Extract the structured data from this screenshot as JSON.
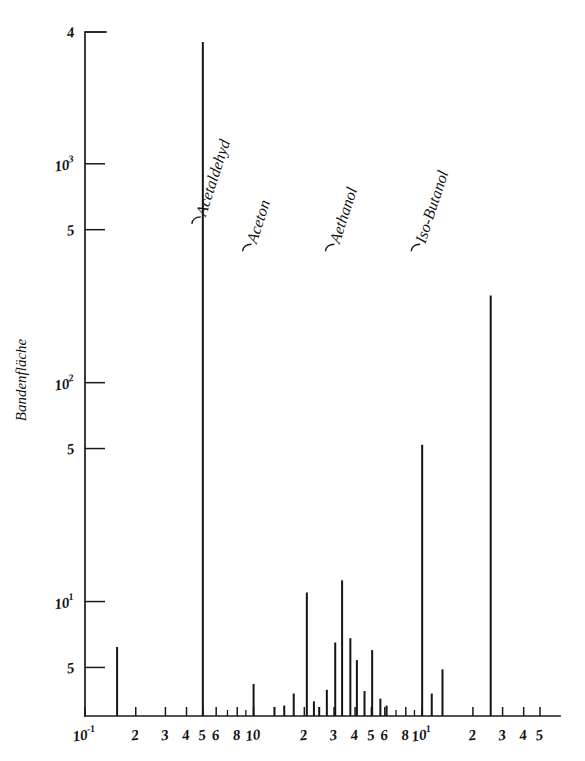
{
  "figure": {
    "title": "",
    "background_color": "#ffffff",
    "ink_color": "#141414"
  },
  "chart_data": {
    "type": "bar",
    "title": "",
    "subtitle": "",
    "xlabel": "",
    "ylabel": "Bandenfläche",
    "xscale": "log",
    "yscale": "log",
    "xlim": [
      0.1,
      50
    ],
    "ylim": [
      3,
      4000
    ],
    "grid": false,
    "legend": "none",
    "x_tick_labels": [
      {
        "value": 0.1,
        "label": "10",
        "sup": "-1",
        "major": true
      },
      {
        "value": 0.2,
        "label": "2",
        "sup": "",
        "major": true
      },
      {
        "value": 0.3,
        "label": "3",
        "sup": "",
        "major": true
      },
      {
        "value": 0.4,
        "label": "4",
        "sup": "",
        "major": true
      },
      {
        "value": 0.5,
        "label": "5",
        "sup": "",
        "major": true
      },
      {
        "value": 0.6,
        "label": "6",
        "sup": "",
        "major": true
      },
      {
        "value": 0.8,
        "label": "8",
        "sup": "",
        "major": true
      },
      {
        "value": 1.0,
        "label": "10",
        "sup": "",
        "major": true
      },
      {
        "value": 2.0,
        "label": "2",
        "sup": "",
        "major": true
      },
      {
        "value": 3.0,
        "label": "3",
        "sup": "",
        "major": true
      },
      {
        "value": 4.0,
        "label": "4",
        "sup": "",
        "major": true
      },
      {
        "value": 5.0,
        "label": "5",
        "sup": "",
        "major": true
      },
      {
        "value": 6.0,
        "label": "6",
        "sup": "",
        "major": true
      },
      {
        "value": 8.0,
        "label": "8",
        "sup": "",
        "major": true
      },
      {
        "value": 10.0,
        "label": "10",
        "sup": "1",
        "major": true
      },
      {
        "value": 20.0,
        "label": "2",
        "sup": "",
        "major": true
      },
      {
        "value": 30.0,
        "label": "3",
        "sup": "",
        "major": true
      },
      {
        "value": 40.0,
        "label": "4",
        "sup": "",
        "major": true
      },
      {
        "value": 50.0,
        "label": "5",
        "sup": "",
        "major": true
      }
    ],
    "x_minor_ticks": [
      0.7,
      0.9,
      7.0,
      9.0
    ],
    "y_tick_labels": [
      {
        "value": 4000,
        "label": "4",
        "sup": ""
      },
      {
        "value": 1000,
        "label": "10",
        "sup": "3"
      },
      {
        "value": 500,
        "label": "5",
        "sup": ""
      },
      {
        "value": 100,
        "label": "10",
        "sup": "2"
      },
      {
        "value": 50,
        "label": "5",
        "sup": ""
      },
      {
        "value": 10,
        "label": "10",
        "sup": "1"
      },
      {
        "value": 5,
        "label": "5",
        "sup": ""
      }
    ],
    "annotations": [
      {
        "text": "Acetaldehyd",
        "x": 0.5,
        "y": 560,
        "leader_to_x": 0.5,
        "name": "acetaldehyd"
      },
      {
        "text": "Aceton",
        "x": 1.0,
        "y": 420,
        "leader_to_x": 1.0,
        "name": "aceton"
      },
      {
        "text": "Aethanol",
        "x": 3.1,
        "y": 420,
        "leader_to_x": 3.1,
        "name": "aethanol"
      },
      {
        "text": "Iso-Butanol",
        "x": 10.0,
        "y": 420,
        "leader_to_x": 10.0,
        "name": "iso-butanol"
      }
    ],
    "categories": [
      "0.155",
      "0.50",
      "1.00",
      "1.33",
      "1.52",
      "1.73",
      "2.07",
      "2.28",
      "2.45",
      "2.72",
      "3.05",
      "3.35",
      "3.75",
      "4.10",
      "4.55",
      "5.05",
      "5.65",
      "6.15",
      "10.0",
      "11.4",
      "13.2",
      "25.5"
    ],
    "values": [
      6.2,
      3600,
      4.2,
      3.3,
      3.35,
      3.8,
      11.0,
      3.5,
      3.3,
      3.95,
      6.5,
      12.5,
      6.8,
      5.4,
      3.9,
      6.0,
      3.6,
      3.35,
      52,
      3.8,
      4.9,
      250
    ],
    "points": [
      {
        "x": 0.155,
        "y": 6.2,
        "label": ""
      },
      {
        "x": 0.5,
        "y": 3600,
        "label": "Acetaldehyd"
      },
      {
        "x": 1.0,
        "y": 4.2,
        "label": "Aceton"
      },
      {
        "x": 1.33,
        "y": 3.3,
        "label": ""
      },
      {
        "x": 1.52,
        "y": 3.35,
        "label": ""
      },
      {
        "x": 1.73,
        "y": 3.8,
        "label": ""
      },
      {
        "x": 2.07,
        "y": 11.0,
        "label": ""
      },
      {
        "x": 2.28,
        "y": 3.5,
        "label": ""
      },
      {
        "x": 2.45,
        "y": 3.3,
        "label": ""
      },
      {
        "x": 2.72,
        "y": 3.95,
        "label": ""
      },
      {
        "x": 3.05,
        "y": 6.5,
        "label": ""
      },
      {
        "x": 3.35,
        "y": 12.5,
        "label": "Aethanol"
      },
      {
        "x": 3.75,
        "y": 6.8,
        "label": ""
      },
      {
        "x": 4.1,
        "y": 5.4,
        "label": ""
      },
      {
        "x": 4.55,
        "y": 3.9,
        "label": ""
      },
      {
        "x": 5.05,
        "y": 6.0,
        "label": ""
      },
      {
        "x": 5.65,
        "y": 3.6,
        "label": ""
      },
      {
        "x": 6.15,
        "y": 3.35,
        "label": ""
      },
      {
        "x": 10.0,
        "y": 52,
        "label": "Iso-Butanol"
      },
      {
        "x": 11.4,
        "y": 3.8,
        "label": ""
      },
      {
        "x": 13.2,
        "y": 4.9,
        "label": ""
      },
      {
        "x": 25.5,
        "y": 250,
        "label": ""
      }
    ]
  }
}
